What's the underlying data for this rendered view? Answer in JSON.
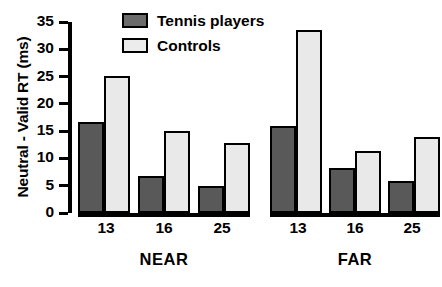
{
  "chart_data": {
    "type": "bar",
    "title": "",
    "xlabel": "",
    "ylabel": "Neutral - Valid RT (ms)",
    "ylim": [
      0,
      35
    ],
    "ytick_labels": [
      "35",
      "30",
      "25",
      "20",
      "15",
      "10",
      "5",
      "0"
    ],
    "ytick_values": [
      35,
      30,
      25,
      20,
      15,
      10,
      5,
      0
    ],
    "ytick_step": 5,
    "grid": false,
    "legend_position": "top-center",
    "panels": [
      {
        "name": "NEAR",
        "categories": [
          "13",
          "16",
          "25"
        ],
        "series": [
          {
            "name": "Tennis players",
            "values": [
              16.7,
              6.7,
              5.0
            ]
          },
          {
            "name": "Controls",
            "values": [
              25.1,
              15.1,
              12.8
            ]
          }
        ]
      },
      {
        "name": "FAR",
        "categories": [
          "13",
          "16",
          "25"
        ],
        "series": [
          {
            "name": "Tennis players",
            "values": [
              15.9,
              8.2,
              5.8
            ]
          },
          {
            "name": "Controls",
            "values": [
              33.6,
              11.3,
              13.9
            ]
          }
        ]
      }
    ],
    "series_colors": {
      "Tennis players": "#595959",
      "Controls": "#e9e9e9"
    }
  },
  "legend": {
    "items": [
      {
        "label": "Tennis players",
        "color": "#6b6b6b"
      },
      {
        "label": "Controls",
        "color": "#ececec"
      }
    ]
  }
}
